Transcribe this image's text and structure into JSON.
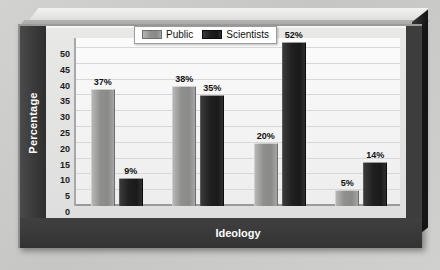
{
  "chart_data": {
    "type": "bar",
    "title": "",
    "xlabel": "Ideology",
    "ylabel": "Percentage",
    "categories": [
      "Conservative",
      "Moderate",
      "Liberal",
      "Very liberal"
    ],
    "series": [
      {
        "name": "Public",
        "values": [
          37,
          38,
          20,
          5
        ],
        "color": "#8f8f8d"
      },
      {
        "name": "Scientists",
        "values": [
          9,
          35,
          52,
          14
        ],
        "color": "#1c1c1c"
      }
    ],
    "value_labels": [
      [
        "37%",
        "38%",
        "20%",
        "5%"
      ],
      [
        "9%",
        "35%",
        "52%",
        "14%"
      ]
    ],
    "ylim": [
      0,
      50
    ],
    "ytick_values": [
      0,
      5,
      10,
      15,
      20,
      25,
      30,
      35,
      40,
      45,
      50
    ],
    "ytick_labels": [
      "0",
      "5",
      "10",
      "15",
      "20",
      "25",
      "30",
      "35",
      "40",
      "45",
      "50"
    ],
    "grid": true,
    "grid_axis": "y",
    "legend_position": "top-left-inside",
    "legend_entries": [
      "Public",
      "Scientists"
    ],
    "value_label_suffix": "%",
    "bar_group_gap": true
  },
  "figure": {
    "background_color": "#c9c9c7",
    "plot_background_color": "#f7f7f7",
    "frame_color": "#3d3d3d",
    "axis_band_text_color": "#ffffff",
    "gridline_color": "#d8d8d8",
    "style": "3d-beveled-plate"
  }
}
